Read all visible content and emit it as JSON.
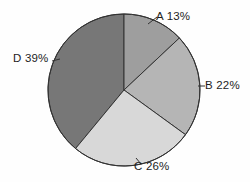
{
  "chart_data": {
    "type": "pie",
    "title": "",
    "subtitle": "",
    "xlabel": "",
    "ylabel": "",
    "legend_position": "none",
    "grid": false,
    "start_angle_deg": 0,
    "direction": "clockwise",
    "units": "percent",
    "total": 100,
    "categories": [
      "A",
      "B",
      "C",
      "D"
    ],
    "values": [
      13,
      22,
      26,
      39
    ],
    "slices": [
      {
        "name": "A",
        "value": 13,
        "label": "A 13%",
        "color": "#9e9e9e",
        "start_deg": 0,
        "end_deg": 46.8,
        "label_position": "top-right",
        "has_leader_line": true
      },
      {
        "name": "B",
        "value": 22,
        "label": "B 22%",
        "color": "#b5b5b5",
        "start_deg": 46.8,
        "end_deg": 126.0,
        "label_position": "right",
        "has_leader_line": true
      },
      {
        "name": "C",
        "value": 26,
        "label": "C 26%",
        "color": "#d8d8d8",
        "start_deg": 126.0,
        "end_deg": 219.6,
        "label_position": "bottom",
        "has_leader_line": true
      },
      {
        "name": "D",
        "value": 39,
        "label": "D 39%",
        "color": "#777777",
        "start_deg": 219.6,
        "end_deg": 360.0,
        "label_position": "left",
        "has_leader_line": true
      }
    ],
    "geometry": {
      "center_x": 124,
      "center_y": 90,
      "radius": 76
    },
    "style": {
      "background": "#fefefe",
      "outline_color": "#333333",
      "outline_width": 1,
      "label_color": "#1d1d1d"
    }
  }
}
